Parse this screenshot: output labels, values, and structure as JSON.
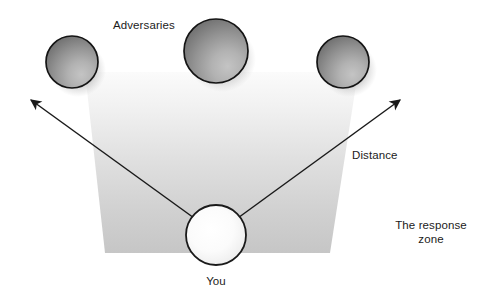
{
  "diagram": {
    "type": "conceptual-diagram",
    "labels": {
      "adversaries": "Adversaries",
      "distance": "Distance",
      "response_zone": "The response\nzone",
      "you": "You"
    },
    "colors": {
      "background": "#ffffff",
      "text": "#1b1b1b",
      "zone_top": "#f7f7f7",
      "zone_bottom": "#c7c7c7",
      "adversary_dark": "#6f6f6f",
      "adversary_light": "#b4b4b4",
      "adversary_stroke": "#141414",
      "you_fill_center": "#ffffff",
      "you_fill_edge": "#e2e2e2",
      "you_stroke": "#1a1a1a",
      "arrow_stroke": "#1a1a1a",
      "shadow": "#9a9a9a"
    },
    "shapes": {
      "response_zone": {
        "name": "response-zone",
        "points": "85,72 358,72 330,253 105,253"
      },
      "adversaries": [
        {
          "name": "adversary-left",
          "cx": 72,
          "cy": 62,
          "r": 26
        },
        {
          "name": "adversary-center",
          "cx": 216,
          "cy": 51,
          "r": 32
        },
        {
          "name": "adversary-right",
          "cx": 343,
          "cy": 62,
          "r": 26
        }
      ],
      "you": {
        "name": "you-node",
        "cx": 216,
        "cy": 235,
        "r": 30
      },
      "arrows": [
        {
          "name": "arrow-left",
          "x1": 212,
          "y1": 231,
          "x2": 28,
          "y2": 98
        },
        {
          "name": "arrow-right",
          "x1": 220,
          "y1": 231,
          "x2": 403,
          "y2": 98
        }
      ]
    }
  }
}
